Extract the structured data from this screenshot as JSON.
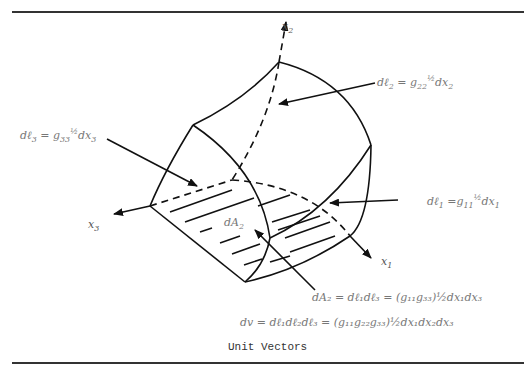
{
  "figure": {
    "caption": "Unit Vectors",
    "axes": {
      "x1": {
        "base": "x",
        "sub": "1"
      },
      "x2": {
        "base": "x",
        "sub": "2"
      },
      "x3": {
        "base": "x",
        "sub": "3"
      }
    },
    "labels": {
      "dl2": {
        "lhs": "dℓ",
        "lhs_sub": "2",
        "eq": " = g",
        "g_sub": "22",
        "exp": "½",
        "rhs": "dx",
        "rhs_sub": "2"
      },
      "dl3": {
        "lhs": "dℓ",
        "lhs_sub": "3",
        "eq": " = g",
        "g_sub": "33",
        "exp": "½",
        "rhs": "dx",
        "rhs_sub": "3"
      },
      "dl1": {
        "lhs": "dℓ",
        "lhs_sub": "1",
        "eq": " =g",
        "g_sub": "11",
        "exp": "½",
        "rhs": "dx",
        "rhs_sub": "1"
      },
      "dA2_tag": {
        "base": "dA",
        "sub": "2"
      },
      "dA2_eq": "dA₂ = dℓ₁dℓ₃ = (g₁₁g₃₃)½dx₁dx₃",
      "dv_eq": "dv = dℓ₁dℓ₂dℓ₃ = (g₁₁g₂₂g₃₃)½dx₁dx₂dx₃"
    }
  }
}
